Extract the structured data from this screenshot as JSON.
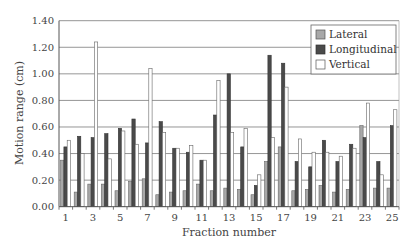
{
  "chart_data": {
    "type": "bar",
    "title": "",
    "xlabel": "Fraction number",
    "ylabel": "Motion range (cm)",
    "ylim": [
      0,
      1.4
    ],
    "yticks": [
      "0.00",
      "0.20",
      "0.40",
      "0.60",
      "0.80",
      "1.00",
      "1.20",
      "1.40"
    ],
    "xtick_labels": [
      "1",
      "3",
      "5",
      "7",
      "9",
      "11",
      "13",
      "15",
      "17",
      "19",
      "21",
      "23",
      "25"
    ],
    "grid": "horizontal",
    "legend_position": "top-right",
    "categories": [
      1,
      2,
      3,
      4,
      5,
      6,
      7,
      8,
      9,
      10,
      11,
      12,
      13,
      14,
      15,
      16,
      17,
      18,
      19,
      20,
      21,
      22,
      23,
      24,
      25
    ],
    "series": [
      {
        "name": "Lateral",
        "color": "#a8a8a8",
        "values": [
          0.35,
          0.11,
          0.17,
          0.17,
          0.12,
          0.19,
          0.21,
          0.09,
          0.11,
          0.12,
          0.17,
          0.12,
          0.14,
          0.13,
          0.09,
          0.34,
          0.45,
          0.12,
          0.13,
          0.16,
          0.11,
          0.13,
          0.61,
          0.14,
          0.14
        ]
      },
      {
        "name": "Longitudinal",
        "color": "#4a4a4a",
        "values": [
          0.45,
          0.53,
          0.52,
          0.55,
          0.59,
          0.66,
          0.48,
          0.64,
          0.44,
          0.41,
          0.35,
          0.69,
          1.0,
          0.45,
          0.16,
          1.14,
          1.08,
          0.34,
          0.3,
          0.5,
          0.34,
          0.47,
          0.52,
          0.34,
          0.61
        ]
      },
      {
        "name": "Vertical",
        "color": "#ffffff",
        "values": [
          0.5,
          0.4,
          1.24,
          0.36,
          0.57,
          0.47,
          1.04,
          0.56,
          0.44,
          0.46,
          0.35,
          0.95,
          0.56,
          0.59,
          0.24,
          0.52,
          0.9,
          0.51,
          0.41,
          0.41,
          0.38,
          0.44,
          0.78,
          0.24,
          0.73
        ]
      }
    ]
  },
  "legend": {
    "items": [
      {
        "label": "Lateral",
        "color": "#a8a8a8"
      },
      {
        "label": "Longitudinal",
        "color": "#4a4a4a"
      },
      {
        "label": "Vertical",
        "color": "#ffffff"
      }
    ]
  }
}
